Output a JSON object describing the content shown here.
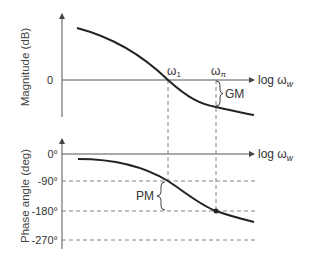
{
  "magnitude_plot": {
    "ylabel": "Magnitude (dB)",
    "xlabel": "log ω",
    "xlabel_sub": "w",
    "zero_tick": "0",
    "crossover_label": "ω",
    "crossover_sub": "1",
    "phase_crossover_label": "ω",
    "phase_crossover_sub": "π",
    "margin_label": "GM"
  },
  "phase_plot": {
    "ylabel": "Phase angle (deg)",
    "xlabel": "log ω",
    "xlabel_sub": "w",
    "ticks": [
      "0°",
      "-90°",
      "-180°",
      "-270°"
    ],
    "margin_label": "PM"
  },
  "colors": {
    "curve": "#222222",
    "axis": "#555555",
    "dashed": "#777777"
  }
}
